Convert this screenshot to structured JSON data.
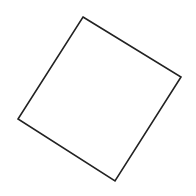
{
  "diagram": {
    "shape": "rotated-square",
    "background": "#ffffff",
    "stroke_color": "#222222",
    "fill_color": "#ffffff",
    "stroke_width": 1.6,
    "vertices": [
      {
        "x": 83,
        "y": 17
      },
      {
        "x": 181,
        "y": 77
      },
      {
        "x": 115,
        "y": 181
      },
      {
        "x": 18,
        "y": 119
      }
    ]
  }
}
